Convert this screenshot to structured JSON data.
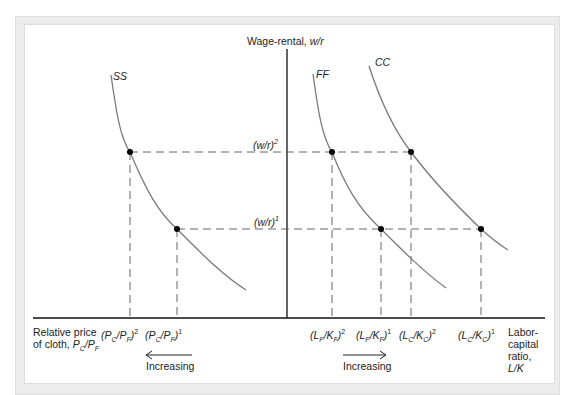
{
  "axes": {
    "y_label_prefix": "Wage-rental, ",
    "y_label_var": "w/r",
    "x_left_label_line1": "Relative price",
    "x_left_label_line2": "of cloth, ",
    "x_left_label_var": "P",
    "x_left_label_sub_c": "C",
    "x_left_label_sub_f": "F",
    "x_right_label_lines": [
      "Labor-",
      "capital",
      "ratio,",
      "L/K"
    ]
  },
  "curves": {
    "ss": "SS",
    "ff": "FF",
    "cc": "CC"
  },
  "wage_levels": {
    "w2": "(w/r)",
    "w2_sup": "2",
    "w1": "(w/r)",
    "w1_sup": "1"
  },
  "tick_labels": {
    "pcpf2": {
      "base": "(P",
      "sub1": "C",
      "mid": "/P",
      "sub2": "F",
      "close": ")",
      "sup": "2"
    },
    "pcpf1": {
      "base": "(P",
      "sub1": "C",
      "mid": "/P",
      "sub2": "F",
      "close": ")",
      "sup": "1"
    },
    "lfkf2": {
      "base": "(L",
      "sub1": "F",
      "mid": "/K",
      "sub2": "F",
      "close": ")",
      "sup": "2"
    },
    "lfkf1": {
      "base": "(L",
      "sub1": "F",
      "mid": "/K",
      "sub2": "F",
      "close": ")",
      "sup": "1"
    },
    "lckc2": {
      "base": "(L",
      "sub1": "C",
      "mid": "/K",
      "sub2": "C",
      "close": ")",
      "sup": "2"
    },
    "lckc1": {
      "base": "(L",
      "sub1": "C",
      "mid": "/K",
      "sub2": "C",
      "close": ")",
      "sup": "1"
    }
  },
  "arrows": {
    "left_label": "Increasing",
    "right_label": "Increasing"
  },
  "colors": {
    "curve": "#7a7a7a",
    "axis": "#111111",
    "dash": "#555555",
    "point": "#000000"
  }
}
